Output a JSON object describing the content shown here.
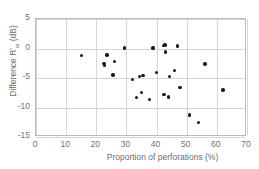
{
  "chart_data": {
    "type": "scatter",
    "title": "",
    "xlabel": "Proportion of perforations (%)",
    "ylabel_parts": {
      "main": "Difference R'",
      "subscript": "w",
      "units": " (dB)"
    },
    "ylabel": "Difference R'w (dB)",
    "xlim": [
      0,
      70
    ],
    "ylim": [
      -15,
      5
    ],
    "xticks": [
      "0",
      "10",
      "20",
      "30",
      "40",
      "50",
      "60",
      "70"
    ],
    "xtick_values": [
      0,
      10,
      20,
      30,
      40,
      50,
      60,
      70
    ],
    "yticks": [
      "5",
      "0",
      "-5",
      "-10",
      "-15"
    ],
    "ytick_values": [
      5,
      0,
      -5,
      -10,
      -15
    ],
    "grid": true,
    "legend": "none",
    "marker": "filled-circle",
    "marker_color": "#1a1a1a",
    "grid_color": "#d6d6d6",
    "axis_color": "#b9b9b9",
    "points": [
      {
        "x": 15.0,
        "y": -1.2
      },
      {
        "x": 22.6,
        "y": -2.5
      },
      {
        "x": 22.7,
        "y": -2.9
      },
      {
        "x": 23.6,
        "y": -1.1
      },
      {
        "x": 26.0,
        "y": -2.2
      },
      {
        "x": 25.6,
        "y": -4.5
      },
      {
        "x": 29.4,
        "y": 0.1
      },
      {
        "x": 32.0,
        "y": -5.3
      },
      {
        "x": 33.3,
        "y": -8.3
      },
      {
        "x": 34.3,
        "y": -4.7
      },
      {
        "x": 34.9,
        "y": -7.5
      },
      {
        "x": 35.5,
        "y": -4.6
      },
      {
        "x": 37.7,
        "y": -8.6
      },
      {
        "x": 38.8,
        "y": 0.1
      },
      {
        "x": 40.0,
        "y": -4.1
      },
      {
        "x": 42.2,
        "y": 0.5
      },
      {
        "x": 42.4,
        "y": -7.8
      },
      {
        "x": 42.8,
        "y": 0.6
      },
      {
        "x": 43.0,
        "y": -0.6
      },
      {
        "x": 44.0,
        "y": -8.2
      },
      {
        "x": 44.3,
        "y": -4.7
      },
      {
        "x": 46.0,
        "y": -3.7
      },
      {
        "x": 47.0,
        "y": 0.4
      },
      {
        "x": 47.8,
        "y": -6.6
      },
      {
        "x": 51.0,
        "y": -11.3
      },
      {
        "x": 54.0,
        "y": -12.5
      },
      {
        "x": 56.0,
        "y": -2.6
      },
      {
        "x": 62.0,
        "y": -7.0
      }
    ]
  }
}
